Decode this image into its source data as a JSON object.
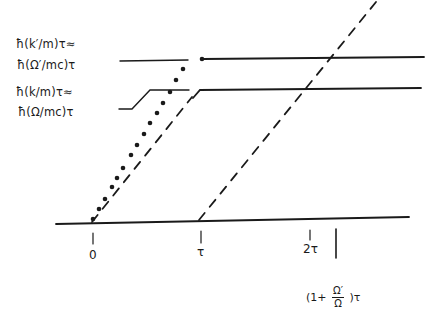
{
  "diagram": {
    "colors": {
      "ink": "#1a1a1a",
      "background": "#ffffff"
    },
    "y_labels": {
      "upper_line1": "ħ(k′/m)τ≈",
      "upper_line2": "ħ(Ω′/mc)τ",
      "lower_line1": "ħ(k/m)τ≈",
      "lower_line2": "ħ(Ω/mc)τ"
    },
    "x_labels": {
      "zero": "0",
      "tau": "τ",
      "two_tau": "2τ",
      "ratio_prefix": "(1+",
      "ratio_num": "Ω′",
      "ratio_den": "Ω",
      "ratio_suffix": ")τ"
    },
    "elements": {
      "baseline": "time axis",
      "upper_level": "ħ(k′/m)τ level",
      "lower_level": "ħ(k/m)τ level",
      "dotted_trajectory": "dotted line from 0 rising to upper level",
      "dashed_trajectory_1": "dashed line from 0 rising to lower level",
      "dashed_trajectory_2": "dashed line from τ rising beyond upper level"
    }
  }
}
